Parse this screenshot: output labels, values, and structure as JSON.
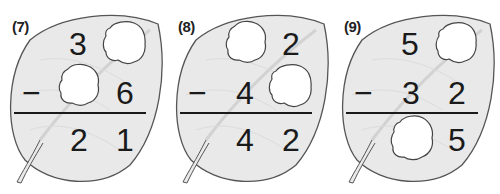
{
  "colors": {
    "leaf_fill": "#e9e9e9",
    "leaf_stroke": "#555555",
    "vein": "#d6d6d6",
    "text": "#1a1a1a",
    "hole": "#ffffff"
  },
  "problems": [
    {
      "label": "(7)",
      "operator": "−",
      "minuend": {
        "tens": "3",
        "ones": ""
      },
      "subtrahend": {
        "tens": "",
        "ones": "6"
      },
      "result": {
        "tens": "2",
        "ones": "1"
      },
      "hidden": [
        "minuend.ones",
        "subtrahend.tens"
      ]
    },
    {
      "label": "(8)",
      "operator": "−",
      "minuend": {
        "tens": "",
        "ones": "2"
      },
      "subtrahend": {
        "tens": "4",
        "ones": ""
      },
      "result": {
        "tens": "4",
        "ones": "2"
      },
      "hidden": [
        "minuend.tens",
        "subtrahend.ones"
      ]
    },
    {
      "label": "(9)",
      "operator": "−",
      "minuend": {
        "tens": "5",
        "ones": ""
      },
      "subtrahend": {
        "tens": "3",
        "ones": "2"
      },
      "result": {
        "tens": "",
        "ones": "5"
      },
      "hidden": [
        "minuend.ones",
        "result.tens"
      ]
    }
  ]
}
